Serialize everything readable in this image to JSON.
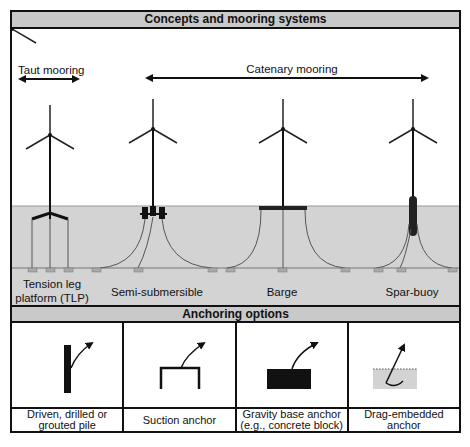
{
  "header": {
    "title": "Concepts and mooring systems"
  },
  "mooring_types": {
    "taut": "Taut mooring",
    "catenary": "Catenary mooring"
  },
  "concepts": [
    {
      "id": "tlp",
      "line1": "Tension leg",
      "line2": "platform (TLP)"
    },
    {
      "id": "semi",
      "label": "Semi-submersible"
    },
    {
      "id": "barge",
      "label": "Barge"
    },
    {
      "id": "spar",
      "label": "Spar-buoy"
    }
  ],
  "anchoring": {
    "title": "Anchoring options",
    "options": [
      {
        "id": "pile",
        "line1": "Driven, drilled or",
        "line2": "grouted pile"
      },
      {
        "id": "suction",
        "line1": "Suction anchor",
        "line2": ""
      },
      {
        "id": "gravity",
        "line1": "Gravity base anchor",
        "line2": "(e.g., concrete block)"
      },
      {
        "id": "drag",
        "line1": "Drag-embedded",
        "line2": "anchor"
      }
    ]
  },
  "colors": {
    "water": "#d3d3d3",
    "header": "#c9c9c9",
    "ink": "#111111",
    "anchor_block": "#a9a9a9"
  }
}
